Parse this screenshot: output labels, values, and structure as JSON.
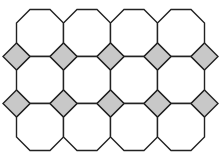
{
  "diagram": {
    "type": "truncated-square-tiling",
    "octagon": {
      "columns": 4,
      "rows": 3,
      "size": 47,
      "corner_cut": 13.5,
      "origin_x": 16.5,
      "origin_y": 9.5,
      "fill": "#ffffff"
    },
    "square": {
      "rows": 2,
      "columns": 5,
      "half_diagonal": 13.5,
      "fill": "#c8c8c8"
    },
    "stroke": "#222222",
    "stroke_width": 1.4,
    "background": "#ffffff"
  }
}
